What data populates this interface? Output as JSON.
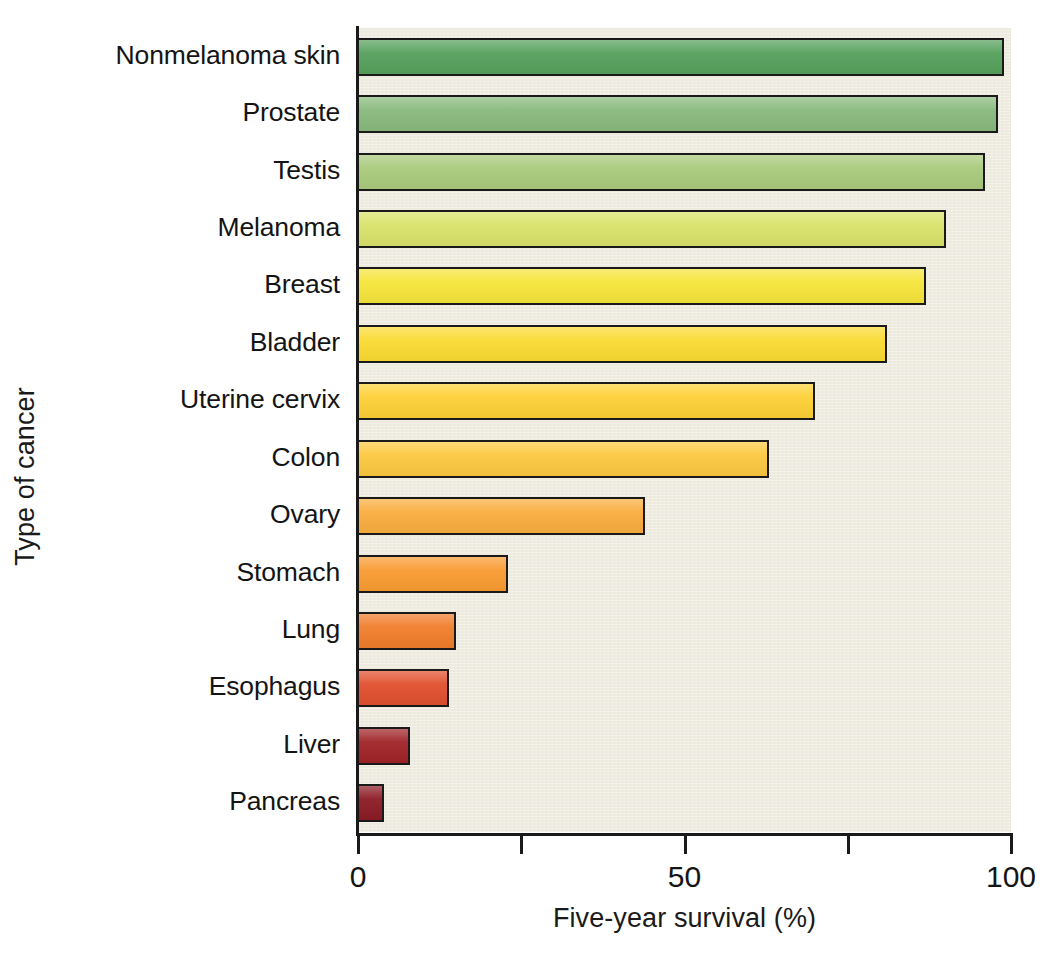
{
  "chart_data": {
    "type": "bar",
    "orientation": "horizontal",
    "title": "",
    "xlabel": "Five-year survival (%)",
    "ylabel": "Type of cancer",
    "xlim": [
      0,
      100
    ],
    "xticks": [
      0,
      25,
      50,
      75,
      100
    ],
    "xtick_labels": [
      "0",
      "",
      "50",
      "",
      "100"
    ],
    "grid": false,
    "legend": null,
    "categories": [
      "Nonmelanoma skin",
      "Prostate",
      "Testis",
      "Melanoma",
      "Breast",
      "Bladder",
      "Uterine cervix",
      "Colon",
      "Ovary",
      "Stomach",
      "Lung",
      "Esophagus",
      "Liver",
      "Pancreas"
    ],
    "values": [
      99,
      98,
      96,
      90,
      87,
      81,
      70,
      63,
      44,
      23,
      15,
      14,
      8,
      4
    ],
    "bar_colors": [
      "#56a05c",
      "#88b97c",
      "#a9ca7c",
      "#d9e269",
      "#f6e53a",
      "#fada32",
      "#fdd036",
      "#fbc83f",
      "#f9ad3e",
      "#f89b31",
      "#f07d2b",
      "#e0502e",
      "#9f2327",
      "#8c1b25"
    ],
    "bar_edge_color": "#1a1a1a",
    "plot_background": "#eeebdf",
    "figure_background": "#ffffff"
  },
  "axes": {
    "x_axis_title": "Five-year survival (%)",
    "y_axis_title": "Type of cancer",
    "x_tick_labels": [
      {
        "value": 0,
        "label": "0"
      },
      {
        "value": 25,
        "label": ""
      },
      {
        "value": 50,
        "label": "50"
      },
      {
        "value": 75,
        "label": ""
      },
      {
        "value": 100,
        "label": "100"
      }
    ]
  },
  "cropped_header": "  "
}
